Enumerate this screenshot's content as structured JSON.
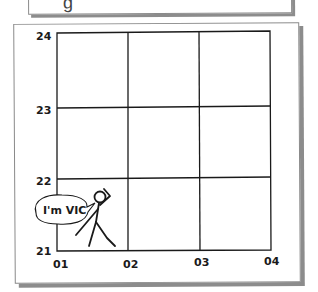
{
  "top_box": {
    "visible_text": "g"
  },
  "grid": {
    "y_labels": [
      "24",
      "23",
      "22",
      "21"
    ],
    "x_labels": [
      "01",
      "02",
      "03",
      "04"
    ]
  },
  "character": {
    "name": "VIC",
    "speech": "I'm VIC"
  },
  "colors": {
    "line": "#1a1a1a",
    "shadow": "#8c8c8c",
    "border": "#8a8a8a",
    "background": "#ffffff"
  }
}
